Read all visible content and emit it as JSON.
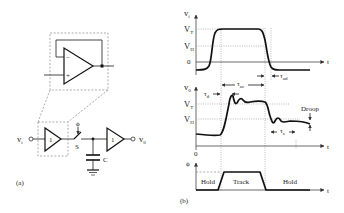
{
  "panel_a": {
    "label": "(a)",
    "input_label": "v",
    "input_sub": "i",
    "output_label": "v",
    "output_sub": "0",
    "buffer1_gain": "1",
    "buffer2_gain": "1",
    "switch_label": "S",
    "phi_label": "ϕ",
    "capacitor_label": "C",
    "opamp_minus": "−",
    "opamp_plus": "+"
  },
  "panel_b": {
    "label": "(b)",
    "input_plot": {
      "y_axis": "v",
      "y_axis_sub": "i",
      "levels": [
        {
          "name": "V",
          "sub": "T"
        },
        {
          "name": "V",
          "sub": "H"
        },
        {
          "name": "0",
          "sub": ""
        }
      ],
      "x_axis": "t",
      "annotations": [
        {
          "sym": "τ",
          "sub": "ac"
        },
        {
          "sym": "τ",
          "sub": "ad"
        }
      ]
    },
    "output_plot": {
      "y_axis": "v",
      "y_axis_sub": "0",
      "levels": [
        {
          "name": "V",
          "sub": "T"
        },
        {
          "name": "V",
          "sub": "H"
        }
      ],
      "origin": "0",
      "x_axis": "t",
      "annotations": [
        {
          "sym": "τ",
          "sub": "d"
        },
        {
          "sym": "τ",
          "sub": "s"
        },
        {
          "text": "Droop"
        }
      ]
    },
    "phi_plot": {
      "y_axis": "ϕ",
      "x_axis": "t",
      "phases": [
        "Hold",
        "Track",
        "Hold"
      ]
    }
  }
}
